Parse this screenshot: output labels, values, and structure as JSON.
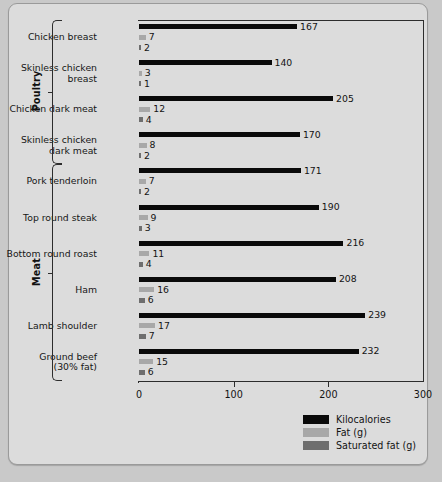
{
  "chart_data": {
    "type": "bar",
    "orientation": "horizontal",
    "title": "",
    "xlabel": "",
    "ylabel": "",
    "xlim": [
      0,
      300
    ],
    "xticks": [
      0,
      100,
      200,
      300
    ],
    "grid": false,
    "legend_position": "bottom-right",
    "legend": [
      "Kilocalories",
      "Fat (g)",
      "Saturated fat (g)"
    ],
    "series": [
      {
        "name": "Kilocalories",
        "color": "#0a0a0a",
        "values": [
          167,
          140,
          205,
          170,
          171,
          190,
          216,
          208,
          239,
          232
        ]
      },
      {
        "name": "Fat (g)",
        "color": "#a8a8a8",
        "values": [
          7,
          3,
          12,
          8,
          7,
          9,
          11,
          16,
          17,
          15
        ]
      },
      {
        "name": "Saturated fat (g)",
        "color": "#6e6e6e",
        "values": [
          2,
          1,
          4,
          2,
          2,
          3,
          4,
          6,
          7,
          6
        ]
      }
    ],
    "categories": [
      "Chicken breast",
      "Skinless chicken breast",
      "Chicken dark meat",
      "Skinless chicken dark meat",
      "Pork tenderloin",
      "Top round steak",
      "Bottom round roast",
      "Ham",
      "Lamb shoulder",
      "Ground beef (30% fat)"
    ],
    "groups": [
      {
        "label": "Poultry",
        "categories": [
          0,
          1,
          2,
          3
        ]
      },
      {
        "label": "Meat",
        "categories": [
          4,
          5,
          6,
          7,
          8,
          9
        ]
      }
    ]
  },
  "rows": [
    {
      "line1": "Chicken breast",
      "line2": "",
      "kcal": 167,
      "fat": 7,
      "sat": 2
    },
    {
      "line1": "Skinless chicken",
      "line2": "breast",
      "kcal": 140,
      "fat": 3,
      "sat": 1
    },
    {
      "line1": "Chicken dark meat",
      "line2": "",
      "kcal": 205,
      "fat": 12,
      "sat": 4
    },
    {
      "line1": "Skinless chicken",
      "line2": "dark meat",
      "kcal": 170,
      "fat": 8,
      "sat": 2
    },
    {
      "line1": "Pork tenderloin",
      "line2": "",
      "kcal": 171,
      "fat": 7,
      "sat": 2
    },
    {
      "line1": "Top round steak",
      "line2": "",
      "kcal": 190,
      "fat": 9,
      "sat": 3
    },
    {
      "line1": "Bottom round roast",
      "line2": "",
      "kcal": 216,
      "fat": 11,
      "sat": 4
    },
    {
      "line1": "Ham",
      "line2": "",
      "kcal": 208,
      "fat": 16,
      "sat": 6
    },
    {
      "line1": "Lamb shoulder",
      "line2": "",
      "kcal": 239,
      "fat": 17,
      "sat": 7
    },
    {
      "line1": "Ground beef",
      "line2": "(30% fat)",
      "kcal": 232,
      "fat": 15,
      "sat": 6
    }
  ],
  "groups": [
    {
      "label": "Poultry"
    },
    {
      "label": "Meat"
    }
  ],
  "axis": {
    "ticks": [
      "0",
      "100",
      "200",
      "300"
    ]
  },
  "legend": [
    {
      "label": "Kilocalories",
      "color": "#0a0a0a"
    },
    {
      "label": "Fat (g)",
      "color": "#a8a8a8"
    },
    {
      "label": "Saturated fat (g)",
      "color": "#6e6e6e"
    }
  ],
  "colors": {
    "kcal": "#0a0a0a",
    "fat": "#a8a8a8",
    "sat": "#6e6e6e",
    "panel": "#dcdcdc",
    "page": "#c9c9c9",
    "axis": "#2d2d2d"
  }
}
